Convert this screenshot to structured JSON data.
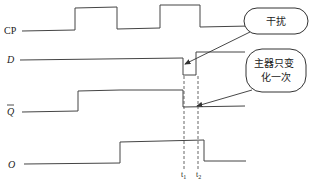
{
  "diagram": {
    "type": "timing-diagram",
    "signals": [
      {
        "id": "cp",
        "label": "CP",
        "italic": false,
        "label_x": 4,
        "label_y": 34,
        "points": "22,31 75,30 75,8 117,7 117,29 160,28 160,5 200,5 200,27 250,26"
      },
      {
        "id": "d",
        "label": "D",
        "italic": true,
        "label_x": 7,
        "label_y": 63,
        "points": "20,60 183,58 183,75 196,75 196,52 245,52"
      },
      {
        "id": "qbar",
        "label": "Q",
        "italic": true,
        "overbar": true,
        "label_x": 7,
        "label_y": 115,
        "points": "22,112 78,111 78,91 120,90 183,90 183,107 245,106"
      },
      {
        "id": "o",
        "label": "O",
        "italic": true,
        "label_x": 8,
        "label_y": 168,
        "points": "24,164 120,163 120,142 204,140 204,161 246,161"
      }
    ],
    "time_markers": [
      {
        "id": "t1",
        "label": "t",
        "sub": "1",
        "x": 184,
        "y1": 76,
        "y2": 170,
        "label_x": 181,
        "label_y": 177
      },
      {
        "id": "t2",
        "label": "t",
        "sub": "2",
        "x": 198,
        "y1": 76,
        "y2": 170,
        "label_x": 196,
        "label_y": 177
      }
    ],
    "callouts": [
      {
        "id": "interference",
        "text_lines": [
          "干扰"
        ],
        "box": {
          "x": 244,
          "y": 8,
          "w": 64,
          "h": 26,
          "r": 13
        },
        "text_x": 276,
        "text_y": 25,
        "arrow": {
          "x1": 250,
          "y1": 32,
          "x2": 185,
          "y2": 64
        }
      },
      {
        "id": "master-changes-once",
        "text_lines": [
          "主器只变",
          "化一次"
        ],
        "box": {
          "x": 246,
          "y": 49,
          "w": 60,
          "h": 43,
          "r": 16
        },
        "text_x": 276,
        "text_y": 67,
        "line_gap": 14,
        "arrow": {
          "x1": 252,
          "y1": 90,
          "x2": 197,
          "y2": 106
        }
      }
    ]
  }
}
